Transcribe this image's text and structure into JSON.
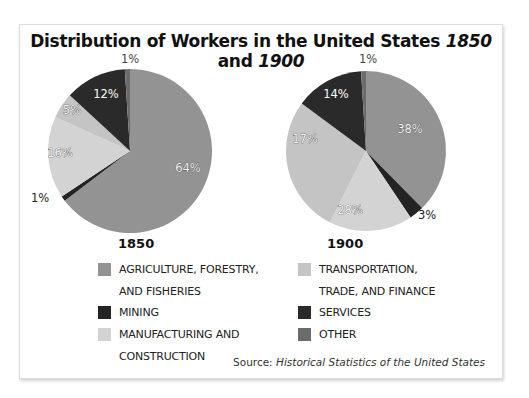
{
  "title": {
    "prefix": "Distribution of Workers in the United States ",
    "year1": "1850",
    "middle": " and ",
    "year2": "1900"
  },
  "colors": {
    "agriculture": "#939393",
    "mining": "#232323",
    "manufacturing": "#d3d3d3",
    "transportation": "#c4c4c4",
    "services": "#2a2a2a",
    "other": "#6c6c6c"
  },
  "legend": {
    "items": [
      {
        "key": "agriculture",
        "label_line1": "AGRICULTURE, FORESTRY,",
        "label_line2": "AND FISHERIES"
      },
      {
        "key": "mining",
        "label_line1": "MINING",
        "label_line2": ""
      },
      {
        "key": "manufacturing",
        "label_line1": "MANUFACTURING AND",
        "label_line2": "CONSTRUCTION"
      },
      {
        "key": "transportation",
        "label_line1": "TRANSPORTATION,",
        "label_line2": "TRADE, AND FINANCE"
      },
      {
        "key": "services",
        "label_line1": "SERVICES",
        "label_line2": ""
      },
      {
        "key": "other",
        "label_line1": "OTHER",
        "label_line2": ""
      }
    ]
  },
  "source": {
    "prefix": "Source: ",
    "title": "Historical Statistics of the United States"
  },
  "chart_data": [
    {
      "type": "pie",
      "title": "1850",
      "categories": [
        "Agriculture, Forestry, and Fisheries",
        "Mining",
        "Manufacturing and Construction",
        "Transportation, Trade, and Finance",
        "Services",
        "Other"
      ],
      "values": [
        64,
        1,
        16,
        5,
        12,
        1
      ],
      "labels": [
        "64%",
        "1%",
        "16%",
        "5%",
        "12%",
        "1%"
      ],
      "legend_position": "bottom"
    },
    {
      "type": "pie",
      "title": "1900",
      "categories": [
        "Agriculture, Forestry, and Fisheries",
        "Mining",
        "Manufacturing and Construction",
        "Transportation, Trade, and Finance",
        "Services",
        "Other"
      ],
      "values": [
        38,
        3,
        17,
        28,
        14,
        1
      ],
      "labels": [
        "38%",
        "3%",
        "17%",
        "28%",
        "14%",
        "1%"
      ],
      "legend_position": "bottom"
    }
  ]
}
